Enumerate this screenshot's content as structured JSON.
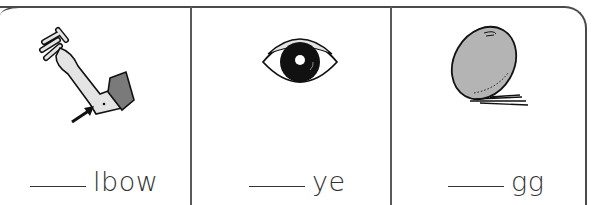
{
  "worksheet": {
    "items": [
      {
        "picture": "elbow-picture",
        "blank": "____",
        "word_ending": "lbow",
        "missing_letter": "e"
      },
      {
        "picture": "eye-picture",
        "blank": "____",
        "word_ending": "ye",
        "missing_letter": "e"
      },
      {
        "picture": "egg-picture",
        "blank": "____",
        "word_ending": "gg",
        "missing_letter": "e"
      }
    ]
  },
  "colors": {
    "border": "#4a4a4a",
    "sleeve": "#7a7a7a",
    "arm": "#e4e4e4",
    "egg": "#b4b4b4",
    "ink": "#111111"
  }
}
